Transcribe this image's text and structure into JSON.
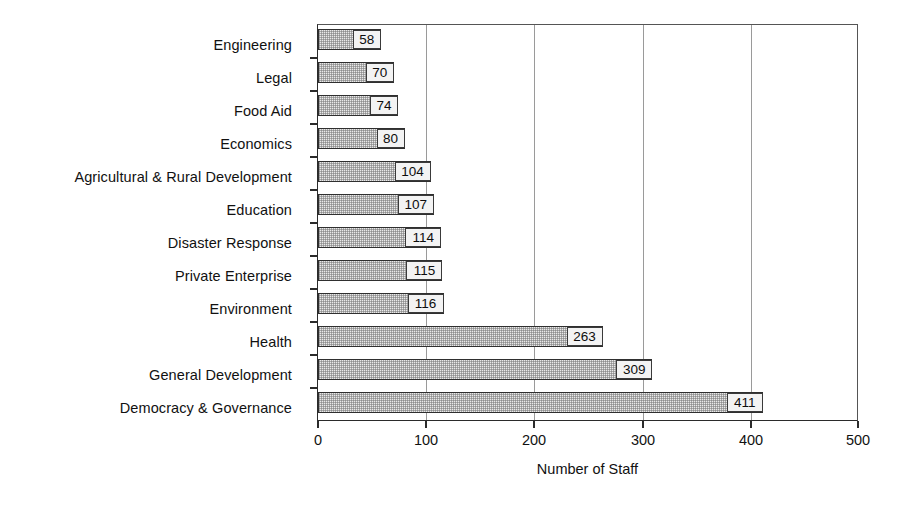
{
  "chart_data": {
    "type": "bar",
    "orientation": "horizontal",
    "title": "",
    "xlabel": "Number of Staff",
    "ylabel": "",
    "xlim": [
      0,
      500
    ],
    "xticks": [
      0,
      100,
      200,
      300,
      400,
      500
    ],
    "xtick_labels": [
      "0",
      "100",
      "200",
      "300",
      "400",
      "500"
    ],
    "grid": "vertical",
    "legend": "none",
    "value_labels": true,
    "categories": [
      "Engineering",
      "Legal",
      "Food Aid",
      "Economics",
      "Agricultural & Rural Development",
      "Education",
      "Disaster Response",
      "Private Enterprise",
      "Environment",
      "Health",
      "General Development",
      "Democracy & Governance"
    ],
    "values": [
      58,
      70,
      74,
      80,
      104,
      107,
      114,
      115,
      116,
      263,
      309,
      411
    ],
    "bars": [
      {
        "category": "Engineering",
        "value": 58,
        "label": "58"
      },
      {
        "category": "Legal",
        "value": 70,
        "label": "70"
      },
      {
        "category": "Food Aid",
        "value": 74,
        "label": "74"
      },
      {
        "category": "Economics",
        "value": 80,
        "label": "80"
      },
      {
        "category": "Agricultural & Rural Development",
        "value": 104,
        "label": "104"
      },
      {
        "category": "Education",
        "value": 107,
        "label": "107"
      },
      {
        "category": "Disaster Response",
        "value": 114,
        "label": "114"
      },
      {
        "category": "Private Enterprise",
        "value": 115,
        "label": "115"
      },
      {
        "category": "Environment",
        "value": 116,
        "label": "116"
      },
      {
        "category": "Health",
        "value": 263,
        "label": "263"
      },
      {
        "category": "General Development",
        "value": 309,
        "label": "309"
      },
      {
        "category": "Democracy & Governance",
        "value": 411,
        "label": "411"
      }
    ],
    "colors": {
      "bar_fill": "#e9e9e9",
      "bar_border": "#2f2f2f",
      "gridline": "#9a9a9a",
      "axis": "#2b2b2b",
      "text": "#111111",
      "background": "#ffffff"
    }
  }
}
